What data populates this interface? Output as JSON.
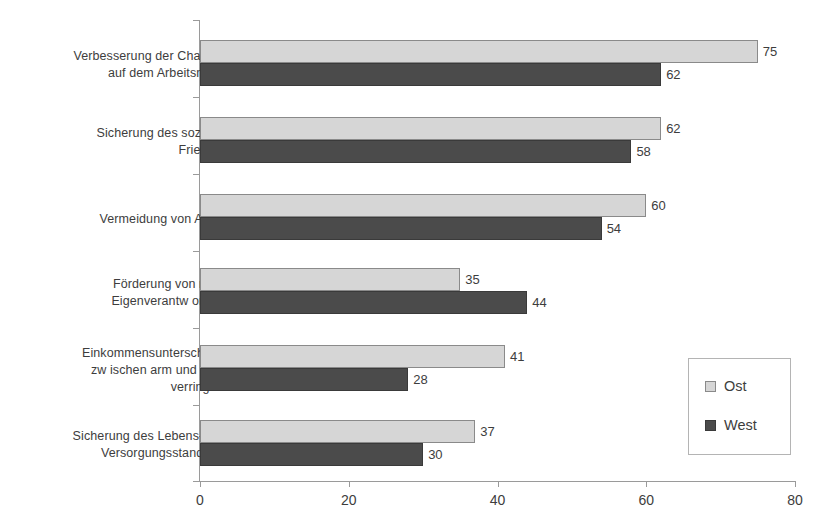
{
  "chart_data": {
    "type": "bar",
    "orientation": "horizontal",
    "title": "",
    "xlabel": "",
    "ylabel": "",
    "xlim": [
      0,
      80
    ],
    "xticks": [
      "0",
      "20",
      "40",
      "60",
      "80"
    ],
    "grid": false,
    "legend_position": "bottom-right",
    "categories": [
      "Verbesserung der Chancen\nauf dem Arbeitsmarkt",
      "Sicherung des sozialen\nFriedens",
      "Vermeidung von Armut",
      "Förderung von mehr\nEigenverantw ortung",
      "Einkommensunterschiede\nzw ischen arm und reich\nverringern",
      "Sicherung des Lebens- und\nVersorgungsstandards"
    ],
    "category_lines": [
      [
        "Verbesserung der Chancen",
        "auf dem Arbeitsmarkt"
      ],
      [
        "Sicherung des sozialen",
        "Friedens"
      ],
      [
        "Vermeidung von Armut"
      ],
      [
        "Förderung von mehr",
        "Eigenverantw ortung"
      ],
      [
        "Einkommensunterschiede",
        "zw ischen arm und reich",
        "verringern"
      ],
      [
        "Sicherung des Lebens- und",
        "Versorgungsstandards"
      ]
    ],
    "series": [
      {
        "name": "Ost",
        "color": "#d6d6d6",
        "values": [
          75,
          62,
          60,
          35,
          41,
          37
        ]
      },
      {
        "name": "West",
        "color": "#4b4b4b",
        "values": [
          62,
          58,
          54,
          44,
          28,
          30
        ]
      }
    ]
  },
  "legend": {
    "items": [
      {
        "label": "Ost"
      },
      {
        "label": "West"
      }
    ]
  },
  "axis": {
    "x_tick_labels": [
      "0",
      "20",
      "40",
      "60",
      "80"
    ]
  }
}
